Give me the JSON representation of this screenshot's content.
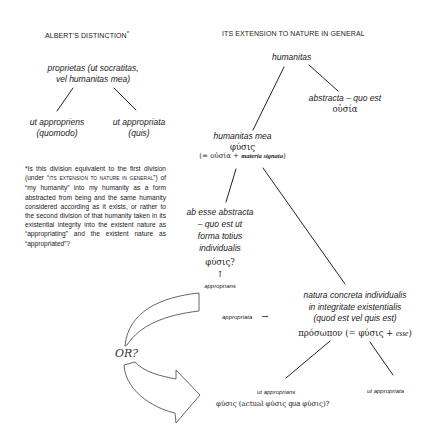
{
  "left_column": {
    "heading": "ALBERT'S DISTINCTION",
    "heading_mark": "*",
    "root": {
      "line1": "proprietas (ut socratitas,",
      "line2": "vel humanitas mea)"
    },
    "children": [
      {
        "line1": "ut appropriens",
        "line2": "(quomodo)"
      },
      {
        "line1": "ut appropriata",
        "line2": "(quis)"
      }
    ],
    "footnote": {
      "mark": "*",
      "part1": "Is this division equivalent to the first division (under “",
      "smallcaps": "ITS EXTENSION TO NATURE IN GENERAL",
      "part2": "”) of “my humanity” into my humanity as a form abstracted from being and the same humanity considered according as it exists, or rather to the second division of that humanity taken in its existential integrity into the existent nature as “appropriating” and the existent nature as “appropriated”?"
    }
  },
  "right_column": {
    "heading": "ITS EXTENSION TO NATURE IN GENERAL",
    "root": "humanitas",
    "abstracta": {
      "line1": "abstracta – quo est",
      "greek": "οὐσία"
    },
    "humanitas_mea": {
      "line1": "humanitas mea",
      "greek": "φύσις",
      "eq_prefix": "(= οὐσία + ",
      "eq_italic": "materia signata",
      "eq_suffix": ")"
    },
    "ab_esse": {
      "lines": [
        "ab esse abstracta",
        "– quo est ut",
        "forma totius",
        "individualis"
      ],
      "greek": "φύσις?",
      "arrow": "↑",
      "label": "approprians"
    },
    "appropriata_arrow": {
      "label": "appropriata",
      "arrow": "→"
    },
    "natura_concreta": {
      "lines": [
        "natura concreta individualis",
        "in integritate existentialis",
        "(quod est vel quis est)"
      ],
      "greek_prefix": "πρόσωπον (= φύσις + ",
      "greek_italic": "esse",
      "greek_suffix": ")"
    },
    "bottom_children": {
      "left_label": "ut approprians",
      "left_sub": "φύσις (actual φύσις ",
      "left_sub_italic": "qua",
      "left_sub_end": " φύσις)?",
      "right_label": "ut appropriata"
    }
  },
  "or_arrows": {
    "label": "OR?"
  }
}
